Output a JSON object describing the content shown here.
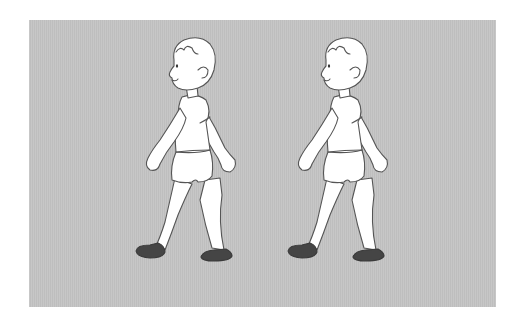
{
  "image": {
    "description": "Two identical cartoon boys walking to the left on a gray background",
    "background_color": "#c4c4c4",
    "page_color": "#ffffff",
    "figures": [
      {
        "label": "boy-left",
        "offset_x": 0
      },
      {
        "label": "boy-right",
        "offset_x": 152
      }
    ],
    "colors": {
      "skin_fill": "#ffffff",
      "outline": "#555555",
      "shoe": "#454545"
    }
  }
}
